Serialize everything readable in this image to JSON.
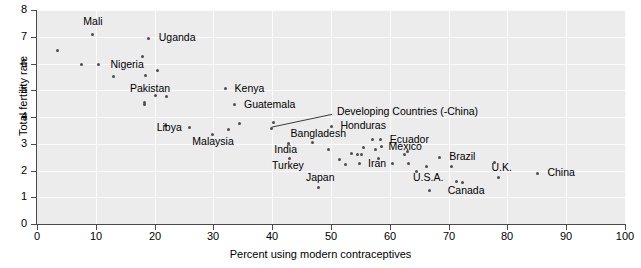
{
  "chart_data": {
    "type": "scatter",
    "title": "",
    "xlabel": "Percent using modern contraceptives",
    "ylabel": "Total fertility rate",
    "xlim": [
      0,
      100
    ],
    "ylim": [
      0,
      8
    ],
    "xticks": [
      0,
      10,
      20,
      30,
      40,
      50,
      60,
      70,
      80,
      90,
      100
    ],
    "yticks": [
      0,
      1,
      2,
      3,
      4,
      5,
      6,
      7,
      8
    ],
    "grid": true,
    "legend": "none",
    "marker_color": "#4d4d4d",
    "plot_background": "#ececec",
    "gridline_color": "#fbfbfb",
    "points": [
      {
        "x": 3.5,
        "y": 6.5,
        "label": ""
      },
      {
        "x": 7.5,
        "y": 5.95,
        "label": ""
      },
      {
        "x": 9.5,
        "y": 7.1,
        "label": "Mali",
        "lx": 9.5,
        "ly": 7.55,
        "align": "center"
      },
      {
        "x": 10.5,
        "y": 5.95,
        "label": "Nigeria",
        "lx": 12.5,
        "ly": 5.95,
        "align": "start"
      },
      {
        "x": 13.0,
        "y": 5.5,
        "label": ""
      },
      {
        "x": 18.0,
        "y": 6.25,
        "label": ""
      },
      {
        "x": 18.5,
        "y": 5.55,
        "label": ""
      },
      {
        "x": 18.3,
        "y": 4.45,
        "label": ""
      },
      {
        "x": 18.3,
        "y": 4.55,
        "label": ""
      },
      {
        "x": 18.9,
        "y": 6.95,
        "label": "Uganda",
        "lx": 20.7,
        "ly": 6.95,
        "align": "start"
      },
      {
        "x": 20.5,
        "y": 5.75,
        "label": ""
      },
      {
        "x": 20.2,
        "y": 4.8,
        "label": "Pakistan",
        "lx": 19.2,
        "ly": 5.05,
        "align": "center"
      },
      {
        "x": 22.0,
        "y": 4.75,
        "label": ""
      },
      {
        "x": 21.8,
        "y": 3.7,
        "label": ""
      },
      {
        "x": 25.9,
        "y": 3.6,
        "label": "Libya",
        "lx": 24.6,
        "ly": 3.6,
        "align": "end"
      },
      {
        "x": 29.9,
        "y": 3.35,
        "label": "Malaysia",
        "lx": 29.9,
        "ly": 3.05,
        "align": "center"
      },
      {
        "x": 32.0,
        "y": 5.05,
        "label": "Kenya",
        "lx": 33.6,
        "ly": 5.05,
        "align": "start"
      },
      {
        "x": 32.6,
        "y": 3.55,
        "label": ""
      },
      {
        "x": 33.6,
        "y": 4.45,
        "label": "Guatemala",
        "lx": 35.2,
        "ly": 4.45,
        "align": "start"
      },
      {
        "x": 34.5,
        "y": 3.75,
        "label": ""
      },
      {
        "x": 39.8,
        "y": 3.58,
        "label": ""
      },
      {
        "x": 40.2,
        "y": 3.8,
        "label": ""
      },
      {
        "x": 42.7,
        "y": 3.0,
        "label": "India",
        "lx": 42.3,
        "ly": 2.78,
        "align": "center"
      },
      {
        "x": 42.9,
        "y": 2.45,
        "label": "Turkey",
        "lx": 42.7,
        "ly": 2.18,
        "align": "center"
      },
      {
        "x": 46.8,
        "y": 3.05,
        "label": "Bangladesh",
        "lx": 47.8,
        "ly": 3.35,
        "align": "center"
      },
      {
        "x": 47.8,
        "y": 1.35,
        "label": "Japan",
        "lx": 48.2,
        "ly": 1.72,
        "align": "center"
      },
      {
        "x": 49.5,
        "y": 2.78,
        "label": ""
      },
      {
        "x": 50.0,
        "y": 3.65,
        "label": "Honduras",
        "lx": 51.6,
        "ly": 3.65,
        "align": "start"
      },
      {
        "x": 51.5,
        "y": 2.4,
        "label": ""
      },
      {
        "x": 52.5,
        "y": 2.22,
        "label": ""
      },
      {
        "x": 53.5,
        "y": 2.65,
        "label": ""
      },
      {
        "x": 54.5,
        "y": 2.58,
        "label": ""
      },
      {
        "x": 55.2,
        "y": 2.58,
        "label": ""
      },
      {
        "x": 54.8,
        "y": 2.25,
        "label": "Iran",
        "lx": 56.3,
        "ly": 2.25,
        "align": "start"
      },
      {
        "x": 55.5,
        "y": 2.85,
        "label": ""
      },
      {
        "x": 57.5,
        "y": 2.8,
        "label": ""
      },
      {
        "x": 57.0,
        "y": 3.15,
        "label": ""
      },
      {
        "x": 58.4,
        "y": 3.15,
        "label": "Ecuador",
        "lx": 60.0,
        "ly": 3.15,
        "align": "start"
      },
      {
        "x": 58.6,
        "y": 2.88,
        "label": "Mexico",
        "lx": 59.8,
        "ly": 2.88,
        "align": "start"
      },
      {
        "x": 58.0,
        "y": 2.45,
        "label": ""
      },
      {
        "x": 60.5,
        "y": 2.25,
        "label": ""
      },
      {
        "x": 62.5,
        "y": 2.6,
        "label": ""
      },
      {
        "x": 63.0,
        "y": 2.7,
        "label": ""
      },
      {
        "x": 63.2,
        "y": 2.25,
        "label": ""
      },
      {
        "x": 64.5,
        "y": 1.95,
        "label": ""
      },
      {
        "x": 66.2,
        "y": 2.15,
        "label": ""
      },
      {
        "x": 66.8,
        "y": 1.25,
        "label": "U.S.A.",
        "lx": 66.5,
        "ly": 1.72,
        "align": "center"
      },
      {
        "x": 68.5,
        "y": 2.5,
        "label": "Brazil",
        "lx": 70.1,
        "ly": 2.5,
        "align": "start"
      },
      {
        "x": 70.5,
        "y": 2.15,
        "label": ""
      },
      {
        "x": 71.3,
        "y": 1.58,
        "label": ""
      },
      {
        "x": 72.3,
        "y": 1.55,
        "label": "Canada",
        "lx": 73.0,
        "ly": 1.22,
        "align": "center"
      },
      {
        "x": 77.8,
        "y": 2.3,
        "label": ""
      },
      {
        "x": 78.5,
        "y": 1.75,
        "label": "U.K.",
        "lx": 79.0,
        "ly": 2.1,
        "align": "center"
      },
      {
        "x": 85.2,
        "y": 1.9,
        "label": "China",
        "lx": 86.8,
        "ly": 1.9,
        "align": "start"
      }
    ],
    "annotations": [
      {
        "text": "Developing Countries (-China)",
        "label_x": 51.0,
        "label_y": 4.18,
        "leader_from": {
          "x": 50.2,
          "y": 4.1
        },
        "leader_to": {
          "x": 39.9,
          "y": 3.62
        }
      }
    ]
  }
}
